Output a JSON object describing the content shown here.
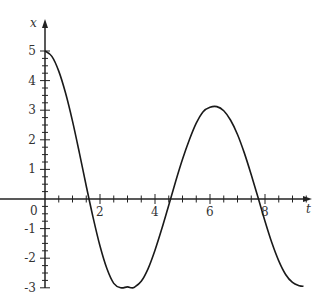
{
  "chart_data": {
    "type": "line",
    "title": "",
    "xlabel": "t",
    "ylabel": "x",
    "xlim": [
      0,
      9.6
    ],
    "ylim": [
      -3,
      5.6
    ],
    "grid": false,
    "legend": null,
    "x_ticks": [
      2,
      4,
      6,
      8
    ],
    "x_tick_labels": [
      "2",
      "4",
      "6",
      "8"
    ],
    "y_ticks": [
      -3,
      -2,
      -1,
      1,
      2,
      3,
      4,
      5
    ],
    "y_tick_labels": [
      "-3",
      "-2",
      "-1",
      "1",
      "2",
      "3",
      "4",
      "5"
    ],
    "origin_label": "0",
    "series": [
      {
        "name": "x(t)",
        "x": [
          0,
          0.25,
          0.5,
          0.75,
          1.0,
          1.25,
          1.5,
          1.75,
          2.0,
          2.25,
          2.5,
          2.75,
          3.0,
          3.14,
          3.25,
          3.5,
          3.75,
          4.0,
          4.25,
          4.5,
          4.75,
          5.0,
          5.25,
          5.5,
          5.75,
          6.0,
          6.25,
          6.5,
          6.75,
          7.0,
          7.25,
          7.5,
          7.75,
          8.0,
          8.25,
          8.5,
          8.75,
          9.0,
          9.25,
          9.4
        ],
        "values": [
          5.0,
          4.82,
          4.32,
          3.57,
          2.63,
          1.56,
          0.44,
          -0.63,
          -1.59,
          -2.35,
          -2.85,
          -3.0,
          -2.97,
          -3.0,
          -2.98,
          -2.78,
          -2.35,
          -1.73,
          -1.0,
          -0.21,
          0.59,
          1.34,
          2.0,
          2.56,
          2.95,
          3.1,
          3.12,
          2.98,
          2.66,
          2.18,
          1.55,
          0.82,
          0.04,
          -0.75,
          -1.48,
          -2.09,
          -2.55,
          -2.82,
          -2.93,
          -2.95
        ]
      }
    ],
    "line_color": "#1a1a1a",
    "annotations": []
  }
}
